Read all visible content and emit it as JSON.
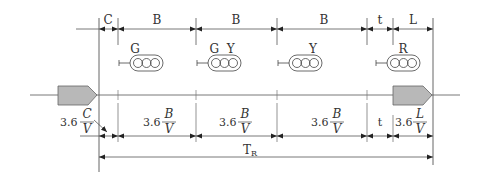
{
  "diagram": {
    "type": "signal-timing-diagram",
    "top_dimensions": [
      {
        "label": "C"
      },
      {
        "label": "B"
      },
      {
        "label": "B"
      },
      {
        "label": "B"
      },
      {
        "label": "t"
      },
      {
        "label": "L"
      }
    ],
    "signals": [
      {
        "label": "G"
      },
      {
        "label": "G  Y"
      },
      {
        "label": "Y"
      },
      {
        "label": "R"
      }
    ],
    "bottom_dimensions": [
      {
        "coef": "3.6",
        "num": "C",
        "den": "V"
      },
      {
        "coef": "3.6",
        "num": "B",
        "den": "V"
      },
      {
        "coef": "3.6",
        "num": "B",
        "den": "V"
      },
      {
        "coef": "3.6",
        "num": "B",
        "den": "V"
      },
      {
        "label": "t"
      },
      {
        "coef": "3.6",
        "num": "L",
        "den": "V"
      }
    ],
    "total": {
      "label": "T",
      "subscript": "R"
    },
    "colors": {
      "line": "#555555",
      "vehicle_fill": "#b8b8b8",
      "vehicle_stroke": "#666666",
      "text": "#333333"
    }
  }
}
